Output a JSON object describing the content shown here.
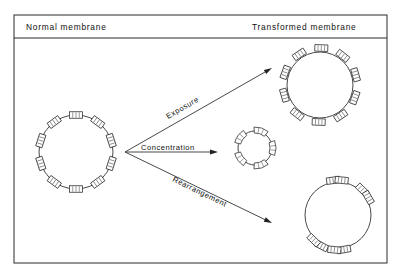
{
  "figure": {
    "title_left": "Normal membrane",
    "title_right": "Transformed membrane",
    "frame": {
      "x": 14,
      "y": 15,
      "width": 373,
      "height": 248,
      "header_divider_y": 38
    },
    "colors": {
      "background": "#ffffff",
      "ink": "#2a2a2a",
      "stroke": "#333333",
      "particle_fill": "#ffffff",
      "arrowhead": "#222222"
    }
  },
  "header": {
    "left": {
      "label": "Normal membrane",
      "x": 26,
      "y": 30
    },
    "right": {
      "label": "Transformed membrane",
      "x": 252,
      "y": 30
    }
  },
  "arrows": [
    {
      "name": "exposure",
      "label": "Exposure",
      "from": [
        125,
        152
      ],
      "to": [
        272,
        68
      ],
      "rotation": -30,
      "label_x": 168,
      "label_y": 119
    },
    {
      "name": "concentration",
      "label": "Concentration",
      "from": [
        125,
        152
      ],
      "to": [
        218,
        152
      ],
      "rotation": 0,
      "label_x": 141,
      "label_y": 150
    },
    {
      "name": "rearrangement",
      "label": "Rearrangement",
      "from": [
        125,
        152
      ],
      "to": [
        272,
        223
      ],
      "rotation": 26,
      "label_x": 172,
      "label_y": 181
    }
  ],
  "vesicles": [
    {
      "name": "normal-membrane-vesicle",
      "caption": "Normal membrane",
      "cx": 76,
      "cy": 152,
      "r": 37,
      "particle_count": 10,
      "particle_style": "rectangular-hatched",
      "particle_distribution": "even",
      "particle_offset": 0,
      "particle_w": 13,
      "particle_h": 6.5,
      "angles": [
        270,
        306,
        342,
        18,
        54,
        90,
        126,
        162,
        198,
        234
      ]
    },
    {
      "name": "exposure-vesicle",
      "caption": "Exposure",
      "cx": 320,
      "cy": 85,
      "r": 33,
      "particle_count": 10,
      "particle_style": "rectangular-hatched",
      "particle_distribution": "even",
      "particle_offset": 4,
      "particle_w": 13,
      "particle_h": 6.5,
      "angles": [
        272,
        308,
        344,
        20,
        56,
        92,
        128,
        164,
        200,
        236
      ]
    },
    {
      "name": "concentration-vesicle",
      "caption": "Concentration",
      "cx": 255,
      "cy": 148,
      "r": 17,
      "particle_count": 5,
      "particle_style": "curved-arc",
      "particle_distribution": "even",
      "particle_offset": 1,
      "particle_w": 13,
      "particle_h": 6,
      "angles": [
        288,
        0,
        72,
        144,
        216
      ]
    },
    {
      "name": "rearrangement-vesicle",
      "caption": "Rearrangement",
      "cx": 338,
      "cy": 215,
      "r": 33,
      "particle_count": 8,
      "particle_style": "rectangular-hatched",
      "particle_distribution": "clustered",
      "particle_offset": 2,
      "particle_w": 13,
      "particle_h": 6.5,
      "angles": [
        262,
        276,
        314,
        330,
        118,
        134,
        80,
        96
      ]
    }
  ]
}
